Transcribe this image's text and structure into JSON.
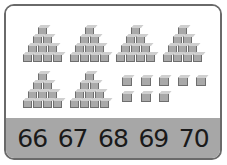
{
  "puzzle": {
    "description": "Count the cubes",
    "pyramids": {
      "count": 6,
      "tiers": [
        1,
        2,
        3,
        4
      ],
      "cubes_each": 10
    },
    "single_cubes": {
      "count": 8,
      "rows": [
        5,
        3
      ]
    },
    "colors": {
      "cube_face": "#a9a9a9",
      "cube_top": "#cfcfcf",
      "cube_edge": "#6e6e6e",
      "answer_bar": "#a7a7a7",
      "border": "#6a6a6a"
    }
  },
  "answers": {
    "options": [
      "66",
      "67",
      "68",
      "69",
      "70"
    ]
  }
}
